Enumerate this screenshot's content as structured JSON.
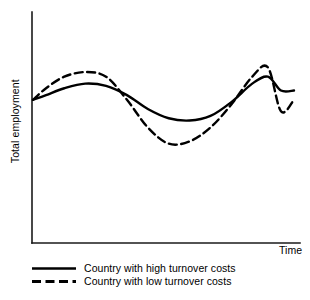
{
  "chart_data": {
    "type": "line",
    "title": "",
    "subtitle": "",
    "xlabel": "Time",
    "ylabel": "Total employment",
    "grid": false,
    "axis_ticks": false,
    "legend_position": "below-left",
    "xlim": [
      0,
      100
    ],
    "ylim": [
      0,
      100
    ],
    "annotations": [],
    "series": [
      {
        "name": "Country with high turnover costs",
        "style": "solid",
        "color": "#000000",
        "x": [
          0,
          5,
          12,
          20,
          28,
          36,
          44,
          52,
          60,
          68,
          76,
          84,
          90,
          95,
          100
        ],
        "y": [
          62,
          64,
          67,
          69,
          68,
          64,
          58,
          54,
          53,
          55,
          61,
          69,
          72,
          66,
          66
        ]
      },
      {
        "name": "Country with low turnover costs",
        "style": "dashed",
        "color": "#000000",
        "x": [
          0,
          5,
          12,
          20,
          28,
          36,
          44,
          52,
          60,
          68,
          76,
          84,
          90,
          95,
          100
        ],
        "y": [
          62,
          67,
          72,
          74,
          72,
          62,
          50,
          43,
          44,
          50,
          60,
          72,
          76,
          57,
          62
        ]
      }
    ]
  },
  "axes": {
    "y_label": "Total employment",
    "x_label": "Time"
  },
  "legend": {
    "items": [
      {
        "label": "Country with high turnover costs",
        "style": "solid"
      },
      {
        "label": "Country with low turnover costs",
        "style": "dashed"
      }
    ]
  },
  "colors": {
    "line": "#000000",
    "axis": "#1a1a1a",
    "background": "#ffffff"
  }
}
